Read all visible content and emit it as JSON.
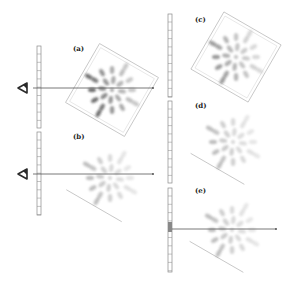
{
  "figure": {
    "panels": [
      {
        "id": "a",
        "label": "(a)",
        "label_pos": [
          73,
          45
        ],
        "viewer": true,
        "ruler": {
          "x": 37,
          "y": 46,
          "h": 82
        },
        "sight_line": {
          "x1": 33,
          "x2": 153,
          "y": 88
        },
        "lattice": {
          "cx": 112,
          "cy": 90,
          "size": 68,
          "rotation": 30,
          "intensity": "dark",
          "frame": "full"
        }
      },
      {
        "id": "b",
        "label": "(b)",
        "label_pos": [
          73,
          133
        ],
        "viewer": true,
        "ruler": {
          "x": 37,
          "y": 132,
          "h": 83
        },
        "sight_line": {
          "x1": 33,
          "x2": 153,
          "y": 174
        },
        "lattice": {
          "cx": 110,
          "cy": 178,
          "size": 64,
          "rotation": 30,
          "intensity": "faint",
          "frame": "partial"
        }
      },
      {
        "id": "c",
        "label": "(c)",
        "label_pos": [
          195,
          16
        ],
        "viewer": false,
        "ruler": {
          "x": 168,
          "y": 14,
          "h": 83
        },
        "lattice": {
          "cx": 236,
          "cy": 57,
          "size": 66,
          "rotation": 30,
          "intensity": "medium",
          "frame": "full"
        }
      },
      {
        "id": "d",
        "label": "(d)",
        "label_pos": [
          195,
          102
        ],
        "viewer": false,
        "ruler": {
          "x": 168,
          "y": 101,
          "h": 82
        },
        "lattice": {
          "cx": 233,
          "cy": 142,
          "size": 62,
          "rotation": 30,
          "intensity": "faint",
          "frame": "partial"
        }
      },
      {
        "id": "e",
        "label": "(e)",
        "label_pos": [
          195,
          187
        ],
        "viewer": false,
        "ruler": {
          "x": 168,
          "y": 188,
          "h": 84,
          "highlight": {
            "y": 222,
            "h": 10
          }
        },
        "sight_line": {
          "x1": 172,
          "x2": 276,
          "y": 229
        },
        "lattice": {
          "cx": 232,
          "cy": 230,
          "size": 62,
          "rotation": 30,
          "intensity": "faint",
          "frame": "partial"
        }
      }
    ],
    "colors": {
      "line": "#555555",
      "ruler": "#8a8a8a",
      "frame": "#b8b8b8",
      "blob_dark": "#3a3a3a",
      "blob_light": "#c8c8c8",
      "eye": "#2a2a2a"
    }
  }
}
